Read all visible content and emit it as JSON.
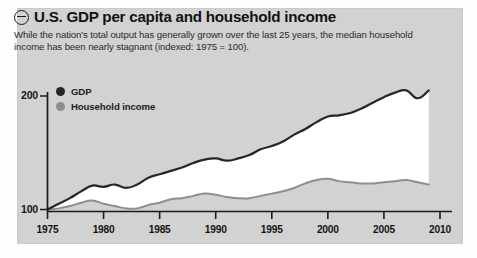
{
  "header": {
    "collapse_icon": "circle-minus-icon",
    "title": "U.S. GDP per capita and household income",
    "subtitle": "While the nation's total output has generally grown over the last 25 years, the median household income has been nearly stagnant (indexed: 1975 = 100)."
  },
  "colors": {
    "panel_background": "#d2d2d2",
    "page_background": "#fdfdfd",
    "gdp_line": "#262626",
    "income_line": "#8e8e8e",
    "band_fill": "#ffffff",
    "axis": "#1a1a1a",
    "text": "#141414"
  },
  "chart_data": {
    "type": "area",
    "title": "U.S. GDP per capita and household income",
    "subtitle": "While the nation's total output has generally grown over the last 25 years, the median household income has been nearly stagnant (indexed: 1975 = 100).",
    "xlabel": "",
    "ylabel": "",
    "xlim": [
      1975,
      2010
    ],
    "ylim": [
      100,
      215
    ],
    "grid": false,
    "legend_position": "top-left",
    "index_note": "indexed: 1975 = 100",
    "xticks": [
      1975,
      1980,
      1985,
      1990,
      1995,
      2000,
      2005,
      2010
    ],
    "xtick_labels": [
      "1975",
      "1980",
      "1985",
      "1990",
      "1995",
      "2000",
      "2005",
      "2010"
    ],
    "yticks": [
      100,
      200
    ],
    "ytick_labels": [
      "100",
      "200"
    ],
    "x": [
      1975,
      1976,
      1977,
      1978,
      1979,
      1980,
      1981,
      1982,
      1983,
      1984,
      1985,
      1986,
      1987,
      1988,
      1989,
      1990,
      1991,
      1992,
      1993,
      1994,
      1995,
      1996,
      1997,
      1998,
      1999,
      2000,
      2001,
      2002,
      2003,
      2004,
      2005,
      2006,
      2007,
      2008,
      2009
    ],
    "series": [
      {
        "name": "GDP",
        "color": "#262626",
        "values": [
          100,
          105,
          110,
          116,
          121,
          120,
          122,
          119,
          122,
          128,
          131,
          134,
          137,
          141,
          144,
          145,
          143,
          145,
          148,
          153,
          156,
          160,
          166,
          171,
          177,
          182,
          183,
          185,
          189,
          194,
          199,
          203,
          205,
          198,
          205
        ]
      },
      {
        "name": "Household income",
        "color": "#8e8e8e",
        "values": [
          100,
          101,
          103,
          106,
          108,
          105,
          103,
          101,
          101,
          104,
          106,
          109,
          110,
          112,
          114,
          113,
          111,
          110,
          110,
          112,
          114,
          116,
          119,
          123,
          126,
          127,
          125,
          124,
          123,
          123,
          124,
          125,
          126,
          124,
          122
        ]
      }
    ]
  },
  "legend": {
    "items": [
      {
        "label": "GDP",
        "color": "#262626",
        "dot": "legend-dot-gdp"
      },
      {
        "label": "Household income",
        "color": "#8e8e8e",
        "dot": "legend-dot-income"
      }
    ]
  }
}
